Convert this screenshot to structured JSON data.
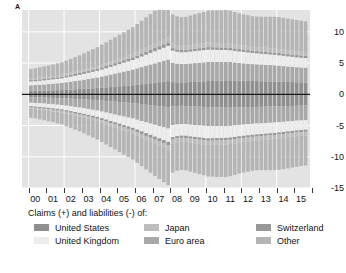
{
  "panel": {
    "letter": "A"
  },
  "legend": {
    "title": "Claims (+) and liabilities (-) of:",
    "entries": [
      {
        "label": "United States",
        "color": "#8f8f8f",
        "key": "united-states"
      },
      {
        "label": "United Kingdom",
        "color": "#ededed",
        "key": "united-kingdom"
      },
      {
        "label": "Japan",
        "color": "#bdbdbd",
        "key": "japan"
      },
      {
        "label": "Euro area",
        "color": "#a8a8a8",
        "key": "euro-area"
      },
      {
        "label": "Switzerland",
        "color": "#989898",
        "key": "switzerland"
      },
      {
        "label": "Other",
        "color": "#b5b5b5",
        "key": "other"
      }
    ]
  },
  "chart_data": {
    "type": "bar",
    "title": "",
    "xlabel": "",
    "ylabel": "",
    "stacked": true,
    "orientation": "vertical",
    "grid": true,
    "grid_color": "#ffffff",
    "plot_background": "#e3e3e3",
    "zero_line_color": "#1a1a1a",
    "legend_position": "below",
    "ylim": [
      -15,
      13.5
    ],
    "yticks": [
      10,
      5,
      0,
      -5,
      -10,
      -15
    ],
    "ytick_labels": [
      "10",
      "5",
      "0",
      "-5",
      "-10",
      "-15"
    ],
    "xlim": [
      1999.5,
      2015.75
    ],
    "xtick_labels": [
      "00",
      "01",
      "02",
      "03",
      "04",
      "05",
      "06",
      "07",
      "08",
      "09",
      "10",
      "11",
      "12",
      "13",
      "14",
      "15"
    ],
    "x": [
      2000.0,
      2000.25,
      2000.5,
      2000.75,
      2001.0,
      2001.25,
      2001.5,
      2001.75,
      2002.0,
      2002.25,
      2002.5,
      2002.75,
      2003.0,
      2003.25,
      2003.5,
      2003.75,
      2004.0,
      2004.25,
      2004.5,
      2004.75,
      2005.0,
      2005.25,
      2005.5,
      2005.75,
      2006.0,
      2006.25,
      2006.5,
      2006.75,
      2007.0,
      2007.25,
      2007.5,
      2007.75,
      2008.0,
      2008.25,
      2008.5,
      2008.75,
      2009.0,
      2009.25,
      2009.5,
      2009.75,
      2010.0,
      2010.25,
      2010.5,
      2010.75,
      2011.0,
      2011.25,
      2011.5,
      2011.75,
      2012.0,
      2012.25,
      2012.5,
      2012.75,
      2013.0,
      2013.25,
      2013.5,
      2013.75,
      2014.0,
      2014.25,
      2014.5,
      2014.75,
      2015.0,
      2015.25,
      2015.5
    ],
    "series_positive": [
      {
        "name": "United States",
        "color": "#8f8f8f",
        "values": [
          0.55,
          0.56,
          0.58,
          0.6,
          0.62,
          0.64,
          0.66,
          0.68,
          0.72,
          0.76,
          0.8,
          0.84,
          0.88,
          0.92,
          0.96,
          1.0,
          1.05,
          1.1,
          1.16,
          1.22,
          1.28,
          1.34,
          1.4,
          1.46,
          1.54,
          1.62,
          1.7,
          1.78,
          1.86,
          1.94,
          2.02,
          2.1,
          1.95,
          1.92,
          1.9,
          1.92,
          1.96,
          2.0,
          2.04,
          2.08,
          2.12,
          2.14,
          2.16,
          2.18,
          2.22,
          2.24,
          2.22,
          2.2,
          2.18,
          2.16,
          2.14,
          2.12,
          2.1,
          2.08,
          2.06,
          2.04,
          2.02,
          2.0,
          1.98,
          1.96,
          1.94,
          1.92,
          1.9
        ]
      },
      {
        "name": "Euro area",
        "color": "#a8a8a8",
        "values": [
          0.9,
          0.92,
          0.95,
          0.98,
          1.02,
          1.06,
          1.1,
          1.14,
          1.2,
          1.26,
          1.32,
          1.38,
          1.46,
          1.54,
          1.62,
          1.7,
          1.8,
          1.9,
          2.0,
          2.1,
          2.2,
          2.3,
          2.4,
          2.5,
          2.62,
          2.74,
          2.86,
          2.98,
          3.1,
          3.22,
          3.34,
          3.46,
          3.1,
          3.0,
          2.95,
          2.95,
          2.98,
          3.0,
          3.02,
          3.04,
          3.06,
          3.04,
          3.02,
          3.0,
          2.98,
          2.94,
          2.88,
          2.82,
          2.78,
          2.74,
          2.7,
          2.68,
          2.66,
          2.64,
          2.62,
          2.6,
          2.56,
          2.52,
          2.48,
          2.44,
          2.4,
          2.38,
          2.36
        ]
      },
      {
        "name": "United Kingdom",
        "color": "#ededed",
        "values": [
          0.6,
          0.62,
          0.64,
          0.66,
          0.68,
          0.7,
          0.72,
          0.74,
          0.78,
          0.82,
          0.86,
          0.9,
          0.94,
          0.98,
          1.02,
          1.06,
          1.12,
          1.18,
          1.24,
          1.3,
          1.36,
          1.42,
          1.48,
          1.54,
          1.62,
          1.7,
          1.78,
          1.86,
          1.94,
          2.02,
          2.1,
          2.18,
          1.95,
          1.9,
          1.88,
          1.88,
          1.9,
          1.92,
          1.94,
          1.96,
          1.98,
          1.96,
          1.94,
          1.92,
          1.9,
          1.88,
          1.86,
          1.84,
          1.82,
          1.8,
          1.78,
          1.76,
          1.74,
          1.72,
          1.7,
          1.68,
          1.66,
          1.64,
          1.62,
          1.6,
          1.58,
          1.56,
          1.54
        ]
      },
      {
        "name": "Switzerland",
        "color": "#989898",
        "values": [
          0.22,
          0.22,
          0.23,
          0.23,
          0.24,
          0.24,
          0.25,
          0.25,
          0.26,
          0.27,
          0.28,
          0.29,
          0.3,
          0.31,
          0.32,
          0.33,
          0.34,
          0.35,
          0.36,
          0.37,
          0.38,
          0.39,
          0.4,
          0.41,
          0.43,
          0.45,
          0.47,
          0.49,
          0.51,
          0.53,
          0.55,
          0.57,
          0.4,
          0.38,
          0.37,
          0.37,
          0.38,
          0.38,
          0.39,
          0.39,
          0.4,
          0.4,
          0.4,
          0.4,
          0.4,
          0.39,
          0.38,
          0.38,
          0.37,
          0.37,
          0.36,
          0.36,
          0.36,
          0.36,
          0.36,
          0.36,
          0.36,
          0.36,
          0.36,
          0.36,
          0.36,
          0.36,
          0.36
        ]
      },
      {
        "name": "Japan",
        "color": "#bdbdbd",
        "values": [
          0.3,
          0.3,
          0.31,
          0.31,
          0.32,
          0.32,
          0.33,
          0.33,
          0.34,
          0.35,
          0.36,
          0.37,
          0.38,
          0.39,
          0.4,
          0.41,
          0.43,
          0.45,
          0.47,
          0.49,
          0.51,
          0.53,
          0.55,
          0.57,
          0.6,
          0.63,
          0.66,
          0.69,
          0.72,
          0.75,
          0.78,
          0.81,
          0.7,
          0.68,
          0.67,
          0.67,
          0.68,
          0.69,
          0.7,
          0.71,
          0.72,
          0.72,
          0.72,
          0.72,
          0.72,
          0.71,
          0.7,
          0.69,
          0.68,
          0.68,
          0.67,
          0.67,
          0.66,
          0.66,
          0.66,
          0.65,
          0.65,
          0.64,
          0.64,
          0.63,
          0.63,
          0.62,
          0.62
        ]
      },
      {
        "name": "Other",
        "color": "#b5b5b5",
        "values": [
          1.5,
          1.55,
          1.62,
          1.68,
          1.75,
          1.82,
          1.9,
          1.98,
          2.1,
          2.22,
          2.34,
          2.46,
          2.6,
          2.75,
          2.9,
          3.05,
          3.2,
          3.35,
          3.5,
          3.65,
          3.8,
          3.95,
          4.1,
          4.25,
          4.45,
          4.65,
          4.85,
          5.05,
          5.25,
          5.4,
          5.55,
          5.7,
          4.7,
          4.6,
          4.58,
          4.62,
          4.72,
          4.82,
          4.92,
          5.02,
          5.12,
          5.18,
          5.22,
          5.24,
          5.28,
          5.24,
          5.14,
          5.04,
          4.98,
          4.92,
          4.88,
          4.86,
          4.9,
          4.96,
          5.02,
          5.08,
          5.12,
          5.1,
          5.06,
          5.02,
          4.98,
          4.94,
          4.9
        ]
      }
    ],
    "series_negative": [
      {
        "name": "United States",
        "color": "#8f8f8f",
        "values": [
          -0.5,
          -0.51,
          -0.52,
          -0.54,
          -0.56,
          -0.58,
          -0.6,
          -0.62,
          -0.66,
          -0.7,
          -0.74,
          -0.78,
          -0.82,
          -0.86,
          -0.9,
          -0.94,
          -1.0,
          -1.06,
          -1.12,
          -1.18,
          -1.24,
          -1.3,
          -1.36,
          -1.42,
          -1.5,
          -1.58,
          -1.66,
          -1.74,
          -1.82,
          -1.9,
          -1.98,
          -2.06,
          -1.9,
          -1.86,
          -1.84,
          -1.86,
          -1.9,
          -1.94,
          -1.98,
          -2.02,
          -2.06,
          -2.08,
          -2.1,
          -2.12,
          -2.14,
          -2.14,
          -2.12,
          -2.1,
          -2.08,
          -2.06,
          -2.04,
          -2.02,
          -2.0,
          -1.98,
          -1.96,
          -1.94,
          -1.92,
          -1.9,
          -1.88,
          -1.86,
          -1.84,
          -1.82,
          -1.8
        ]
      },
      {
        "name": "Euro area",
        "color": "#a8a8a8",
        "values": [
          -0.85,
          -0.88,
          -0.91,
          -0.94,
          -0.98,
          -1.02,
          -1.06,
          -1.1,
          -1.16,
          -1.22,
          -1.28,
          -1.34,
          -1.42,
          -1.5,
          -1.58,
          -1.66,
          -1.76,
          -1.86,
          -1.96,
          -2.06,
          -2.16,
          -2.26,
          -2.36,
          -2.46,
          -2.58,
          -2.7,
          -2.82,
          -2.94,
          -3.06,
          -3.18,
          -3.3,
          -3.42,
          -3.05,
          -2.96,
          -2.92,
          -2.92,
          -2.95,
          -2.98,
          -3.0,
          -3.02,
          -3.04,
          -3.02,
          -3.0,
          -2.98,
          -2.96,
          -2.92,
          -2.86,
          -2.8,
          -2.76,
          -2.72,
          -2.68,
          -2.66,
          -2.64,
          -2.62,
          -2.6,
          -2.58,
          -2.54,
          -2.5,
          -2.46,
          -2.42,
          -2.38,
          -2.36,
          -2.34
        ]
      },
      {
        "name": "United Kingdom",
        "color": "#ededed",
        "values": [
          -0.55,
          -0.57,
          -0.59,
          -0.61,
          -0.63,
          -0.65,
          -0.67,
          -0.69,
          -0.73,
          -0.77,
          -0.81,
          -0.85,
          -0.89,
          -0.93,
          -0.97,
          -1.01,
          -1.07,
          -1.13,
          -1.19,
          -1.25,
          -1.31,
          -1.37,
          -1.43,
          -1.49,
          -1.57,
          -1.65,
          -1.73,
          -1.81,
          -1.89,
          -1.97,
          -2.05,
          -2.13,
          -1.92,
          -1.88,
          -1.86,
          -1.86,
          -1.88,
          -1.9,
          -1.92,
          -1.94,
          -1.96,
          -1.94,
          -1.92,
          -1.9,
          -1.88,
          -1.86,
          -1.84,
          -1.82,
          -1.8,
          -1.78,
          -1.76,
          -1.74,
          -1.72,
          -1.7,
          -1.68,
          -1.66,
          -1.64,
          -1.62,
          -1.6,
          -1.58,
          -1.56,
          -1.54,
          -1.52
        ]
      },
      {
        "name": "Switzerland",
        "color": "#989898",
        "values": [
          -0.2,
          -0.2,
          -0.21,
          -0.21,
          -0.22,
          -0.22,
          -0.23,
          -0.23,
          -0.24,
          -0.25,
          -0.26,
          -0.27,
          -0.28,
          -0.29,
          -0.3,
          -0.31,
          -0.32,
          -0.33,
          -0.34,
          -0.35,
          -0.36,
          -0.37,
          -0.38,
          -0.39,
          -0.41,
          -0.43,
          -0.45,
          -0.47,
          -0.49,
          -0.51,
          -0.53,
          -0.55,
          -0.38,
          -0.36,
          -0.35,
          -0.35,
          -0.36,
          -0.36,
          -0.37,
          -0.37,
          -0.38,
          -0.38,
          -0.38,
          -0.38,
          -0.38,
          -0.37,
          -0.36,
          -0.36,
          -0.35,
          -0.35,
          -0.34,
          -0.34,
          -0.34,
          -0.34,
          -0.34,
          -0.34,
          -0.34,
          -0.34,
          -0.34,
          -0.34,
          -0.34,
          -0.34,
          -0.34
        ]
      },
      {
        "name": "Japan",
        "color": "#bdbdbd",
        "values": [
          -0.26,
          -0.26,
          -0.27,
          -0.27,
          -0.28,
          -0.28,
          -0.29,
          -0.29,
          -0.3,
          -0.31,
          -0.32,
          -0.33,
          -0.34,
          -0.35,
          -0.36,
          -0.37,
          -0.39,
          -0.41,
          -0.43,
          -0.45,
          -0.47,
          -0.49,
          -0.51,
          -0.53,
          -0.56,
          -0.59,
          -0.62,
          -0.65,
          -0.68,
          -0.71,
          -0.74,
          -0.77,
          -0.66,
          -0.64,
          -0.63,
          -0.63,
          -0.64,
          -0.65,
          -0.66,
          -0.67,
          -0.68,
          -0.68,
          -0.68,
          -0.68,
          -0.68,
          -0.67,
          -0.66,
          -0.65,
          -0.64,
          -0.64,
          -0.63,
          -0.63,
          -0.62,
          -0.62,
          -0.62,
          -0.61,
          -0.61,
          -0.6,
          -0.6,
          -0.59,
          -0.59,
          -0.58,
          -0.58
        ]
      },
      {
        "name": "Other",
        "color": "#b5b5b5",
        "values": [
          -1.4,
          -1.45,
          -1.52,
          -1.58,
          -1.65,
          -1.72,
          -1.8,
          -1.88,
          -2.0,
          -2.12,
          -2.24,
          -2.36,
          -2.5,
          -2.65,
          -2.8,
          -2.95,
          -3.1,
          -3.25,
          -3.4,
          -3.55,
          -3.7,
          -3.85,
          -4.0,
          -4.15,
          -4.35,
          -4.55,
          -4.75,
          -4.95,
          -5.15,
          -5.3,
          -5.45,
          -5.6,
          -4.62,
          -4.52,
          -4.5,
          -4.54,
          -4.64,
          -4.74,
          -4.84,
          -4.94,
          -5.04,
          -5.1,
          -5.14,
          -5.16,
          -5.2,
          -5.16,
          -5.06,
          -4.96,
          -4.9,
          -4.84,
          -4.8,
          -4.78,
          -4.82,
          -4.88,
          -4.94,
          -5.0,
          -5.04,
          -5.02,
          -4.98,
          -4.94,
          -4.9,
          -4.86,
          -4.82
        ]
      }
    ]
  }
}
